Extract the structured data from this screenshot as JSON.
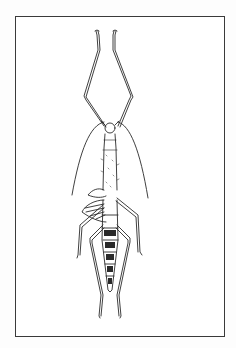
{
  "figure": {
    "colors": {
      "ink": "#2a2a2a",
      "border": "#3a3a3a",
      "background": "#ffffff"
    }
  }
}
